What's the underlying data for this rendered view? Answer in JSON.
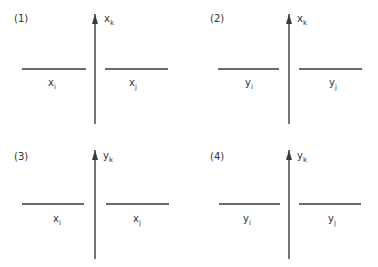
{
  "diagram": {
    "panels": [
      {
        "id": "1",
        "label": "(1)",
        "axis": {
          "var": "x",
          "sub": "k"
        },
        "left": {
          "var": "x",
          "sub": "i"
        },
        "right": {
          "var": "x",
          "sub": "j"
        }
      },
      {
        "id": "2",
        "label": "(2)",
        "axis": {
          "var": "x",
          "sub": "k"
        },
        "left": {
          "var": "y",
          "sub": "i"
        },
        "right": {
          "var": "y",
          "sub": "j"
        }
      },
      {
        "id": "3",
        "label": "(3)",
        "axis": {
          "var": "y",
          "sub": "k"
        },
        "left": {
          "var": "x",
          "sub": "i"
        },
        "right": {
          "var": "x",
          "sub": "j"
        }
      },
      {
        "id": "4",
        "label": "(4)",
        "axis": {
          "var": "y",
          "sub": "k"
        },
        "left": {
          "var": "y",
          "sub": "i"
        },
        "right": {
          "var": "y",
          "sub": "j"
        }
      }
    ],
    "colors": {
      "line": "#3a3a3a",
      "text": "#333333",
      "background": "#ffffff"
    }
  }
}
